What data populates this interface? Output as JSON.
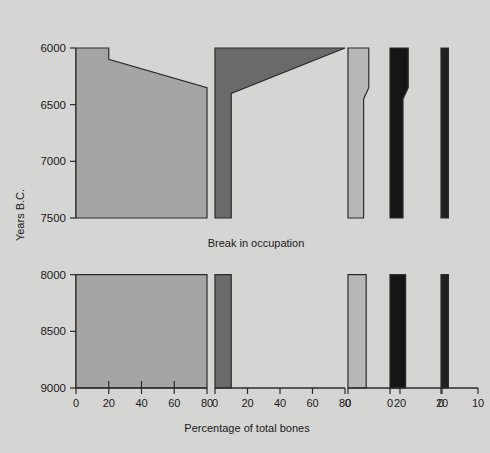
{
  "figure": {
    "y_axis_title": "Years B.C.",
    "x_axis_title": "Percentage of total bones",
    "break_note": "Break in occupation"
  },
  "columns": [
    {
      "key": "gazelle",
      "title": "Gazelle",
      "color": "#a5a5a3",
      "xmax": 80,
      "ticks": [
        0,
        20,
        40,
        60,
        80
      ]
    },
    {
      "key": "sheep_goat",
      "title": "Sheep and goat",
      "color": "#6a6a6a",
      "xmax": 80,
      "ticks": [
        0,
        20,
        40,
        60,
        80
      ]
    },
    {
      "key": "wild_ass",
      "title_line1": "Wild",
      "title_line2": "ass",
      "title": "Wild ass",
      "color": "#b7b7b5",
      "xmax": 20,
      "ticks": [
        0,
        20
      ]
    },
    {
      "key": "wild_cattle",
      "title_line1": "Wild",
      "title_line2": "cattle",
      "title": "Wild cattle",
      "color": "#151515",
      "xmax": 20,
      "ticks": [
        0,
        20
      ]
    },
    {
      "key": "wild_pig_deer",
      "title_line1": "Wild pig",
      "title_line2": "and deer",
      "title": "Wild pig and deer",
      "color": "#202020",
      "xmax": 10,
      "ticks": [
        0,
        10
      ]
    }
  ],
  "y_ticks": [
    6000,
    6500,
    7000,
    7500,
    8000,
    8500,
    9000
  ],
  "chart_data": {
    "type": "area",
    "xlabel": "Percentage of total bones",
    "ylabel": "Years B.C.",
    "ylim": [
      6000,
      9000
    ],
    "y_inverted": false,
    "grid": false,
    "legend": "column headers above each panel",
    "annotations": [
      "Break in occupation between 7500 and 8000 B.C."
    ],
    "note": "Each species is drawn as its own panel with its own percentage axis; y axis is shared (Years B.C., 6000 at top to 9000 at bottom). Occupation gap spans 7500-8000 B.C. where no bars are drawn.",
    "panels": [
      {
        "name": "Gazelle",
        "xlim": [
          0,
          80
        ],
        "xticks": [
          0,
          20,
          40,
          60,
          80
        ],
        "color": "#a5a5a3",
        "upper_segment": {
          "years": [
            6000,
            6100,
            6350,
            7500
          ],
          "percent": [
            20,
            20,
            80,
            80
          ],
          "description": "Narrow 20% band at 6000 B.C., steps out then slopes to 80% by ~6350 B.C., constant 80% down to 7500 B.C."
        },
        "lower_segment": {
          "years": [
            8000,
            9000
          ],
          "percent": [
            80,
            80
          ],
          "description": "Constant 80% from 8000 to 9000 B.C."
        }
      },
      {
        "name": "Sheep and goat",
        "xlim": [
          0,
          80
        ],
        "xticks": [
          0,
          20,
          40,
          60,
          80
        ],
        "color": "#6a6a6a",
        "upper_segment": {
          "years": [
            6000,
            6400,
            7500
          ],
          "percent": [
            80,
            10,
            10
          ],
          "description": "80% at 6000 B.C. declining sharply to 10% by ~6400 B.C., then constant 10% down to 7500 B.C."
        },
        "lower_segment": {
          "years": [
            8000,
            9000
          ],
          "percent": [
            10,
            10
          ],
          "description": "Constant 10% from 8000 to 9000 B.C."
        }
      },
      {
        "name": "Wild ass",
        "xlim": [
          0,
          20
        ],
        "xticks": [
          0,
          20
        ],
        "color": "#b7b7b5",
        "upper_segment": {
          "years": [
            6000,
            6350,
            6450,
            7500
          ],
          "percent": [
            8,
            8,
            6,
            6
          ],
          "description": "About 8% at 6000 B.C., narrowing slightly to about 6% after ~6400 B.C. and holding to 7500 B.C."
        },
        "lower_segment": {
          "years": [
            8000,
            9000
          ],
          "percent": [
            7,
            7
          ],
          "description": "About 7% from 8000 to 9000 B.C."
        }
      },
      {
        "name": "Wild cattle",
        "xlim": [
          0,
          20
        ],
        "xticks": [
          0,
          20
        ],
        "color": "#151515",
        "upper_segment": {
          "years": [
            6000,
            6350,
            6450,
            7500
          ],
          "percent": [
            7,
            7,
            5,
            5
          ],
          "description": "About 7% at 6000 B.C., narrowing to about 5% after ~6400 B.C. and holding to 7500 B.C."
        },
        "lower_segment": {
          "years": [
            8000,
            9000
          ],
          "percent": [
            6,
            6
          ],
          "description": "About 6% from 8000 to 9000 B.C."
        }
      },
      {
        "name": "Wild pig and deer",
        "xlim": [
          0,
          10
        ],
        "xticks": [
          0,
          10
        ],
        "color": "#202020",
        "upper_segment": {
          "years": [
            6000,
            7500
          ],
          "percent": [
            2,
            2
          ],
          "description": "A thin constant band of about 2% from 6000 to 7500 B.C."
        },
        "lower_segment": {
          "years": [
            8000,
            9000
          ],
          "percent": [
            2,
            2
          ],
          "description": "A thin constant band of about 2% from 8000 to 9000 B.C."
        }
      }
    ]
  }
}
